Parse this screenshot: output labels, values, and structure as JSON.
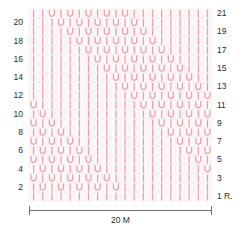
{
  "chart": {
    "stitch_count": 20,
    "row_count": 21,
    "colors": {
      "symbol": "#f09aad",
      "symbol_light": "#f7c6d1",
      "grid_line": "#eef0ee",
      "background": "#fdf7f8",
      "text": "#2b2b2b",
      "rule": "#6e6e6e"
    },
    "symbols": {
      "knit": "I",
      "purl": "U"
    },
    "left_labels": [
      "20",
      "18",
      "16",
      "14",
      "12",
      "10",
      "8",
      "6",
      "4",
      "2"
    ],
    "left_label_rows": [
      20,
      18,
      16,
      14,
      12,
      10,
      8,
      6,
      4,
      2
    ],
    "right_labels": [
      "21",
      "19",
      "17",
      "15",
      "13",
      "11",
      "9",
      "7",
      "5",
      "3",
      "1 R."
    ],
    "right_label_rows": [
      21,
      19,
      17,
      15,
      13,
      11,
      9,
      7,
      5,
      3,
      1
    ],
    "scale": {
      "label": "20 M",
      "value": 20,
      "unit": "M"
    },
    "rows": [
      {
        "row": 21,
        "cells": [
          "I",
          "I",
          "U",
          "I",
          "U",
          "I",
          "U",
          "I",
          "U",
          "I",
          "U",
          "I",
          "I",
          "I",
          "I",
          "I",
          "I",
          "I",
          "I",
          "I"
        ]
      },
      {
        "row": 20,
        "cells": [
          "I",
          "I",
          "I",
          "U",
          "I",
          "U",
          "I",
          "U",
          "I",
          "U",
          "I",
          "U",
          "I",
          "I",
          "I",
          "I",
          "I",
          "I",
          "I",
          "I"
        ]
      },
      {
        "row": 19,
        "cells": [
          "I",
          "I",
          "I",
          "I",
          "U",
          "I",
          "U",
          "I",
          "U",
          "I",
          "U",
          "I",
          "U",
          "I",
          "I",
          "I",
          "I",
          "I",
          "I",
          "I"
        ]
      },
      {
        "row": 18,
        "cells": [
          "I",
          "I",
          "I",
          "I",
          "I",
          "U",
          "I",
          "U",
          "I",
          "U",
          "I",
          "U",
          "I",
          "U",
          "I",
          "I",
          "I",
          "I",
          "I",
          "I"
        ]
      },
      {
        "row": 17,
        "cells": [
          "I",
          "I",
          "I",
          "I",
          "I",
          "I",
          "U",
          "I",
          "U",
          "I",
          "U",
          "I",
          "U",
          "I",
          "U",
          "I",
          "I",
          "I",
          "I",
          "I"
        ]
      },
      {
        "row": 16,
        "cells": [
          "I",
          "I",
          "I",
          "I",
          "I",
          "I",
          "I",
          "U",
          "I",
          "U",
          "I",
          "U",
          "I",
          "U",
          "I",
          "U",
          "I",
          "I",
          "I",
          "I"
        ]
      },
      {
        "row": 15,
        "cells": [
          "I",
          "I",
          "I",
          "I",
          "I",
          "I",
          "I",
          "I",
          "U",
          "I",
          "U",
          "I",
          "U",
          "I",
          "U",
          "I",
          "U",
          "I",
          "I",
          "I"
        ]
      },
      {
        "row": 14,
        "cells": [
          "I",
          "I",
          "I",
          "I",
          "I",
          "I",
          "I",
          "I",
          "I",
          "U",
          "I",
          "U",
          "I",
          "U",
          "I",
          "U",
          "I",
          "U",
          "I",
          "I"
        ]
      },
      {
        "row": 13,
        "cells": [
          "I",
          "I",
          "I",
          "I",
          "I",
          "I",
          "I",
          "I",
          "I",
          "I",
          "U",
          "I",
          "U",
          "I",
          "U",
          "I",
          "U",
          "I",
          "U",
          "I"
        ]
      },
      {
        "row": 12,
        "cells": [
          "I",
          "I",
          "I",
          "I",
          "I",
          "I",
          "I",
          "I",
          "I",
          "I",
          "I",
          "U",
          "I",
          "U",
          "I",
          "U",
          "I",
          "U",
          "I",
          "U"
        ]
      },
      {
        "row": 11,
        "cells": [
          "U",
          "I",
          "I",
          "I",
          "I",
          "I",
          "I",
          "I",
          "I",
          "I",
          "I",
          "I",
          "U",
          "I",
          "U",
          "I",
          "U",
          "I",
          "U",
          "I"
        ]
      },
      {
        "row": 10,
        "cells": [
          "I",
          "U",
          "I",
          "I",
          "I",
          "I",
          "I",
          "I",
          "I",
          "I",
          "I",
          "I",
          "I",
          "U",
          "I",
          "U",
          "I",
          "U",
          "I",
          "U"
        ]
      },
      {
        "row": 9,
        "cells": [
          "U",
          "I",
          "U",
          "I",
          "I",
          "I",
          "I",
          "I",
          "I",
          "I",
          "I",
          "I",
          "I",
          "I",
          "U",
          "I",
          "U",
          "I",
          "U",
          "I"
        ]
      },
      {
        "row": 8,
        "cells": [
          "I",
          "U",
          "I",
          "U",
          "I",
          "I",
          "I",
          "I",
          "I",
          "I",
          "I",
          "I",
          "I",
          "I",
          "I",
          "U",
          "I",
          "U",
          "I",
          "U"
        ]
      },
      {
        "row": 7,
        "cells": [
          "U",
          "I",
          "U",
          "I",
          "U",
          "I",
          "I",
          "I",
          "I",
          "I",
          "I",
          "I",
          "I",
          "I",
          "I",
          "I",
          "U",
          "I",
          "U",
          "I"
        ]
      },
      {
        "row": 6,
        "cells": [
          "I",
          "U",
          "I",
          "U",
          "I",
          "U",
          "I",
          "I",
          "I",
          "I",
          "I",
          "I",
          "I",
          "I",
          "I",
          "I",
          "I",
          "U",
          "I",
          "U"
        ]
      },
      {
        "row": 5,
        "cells": [
          "U",
          "I",
          "U",
          "I",
          "U",
          "I",
          "U",
          "I",
          "I",
          "I",
          "I",
          "I",
          "I",
          "I",
          "I",
          "I",
          "I",
          "I",
          "U",
          "I"
        ]
      },
      {
        "row": 4,
        "cells": [
          "I",
          "U",
          "I",
          "U",
          "I",
          "U",
          "I",
          "U",
          "I",
          "I",
          "I",
          "I",
          "I",
          "I",
          "I",
          "I",
          "I",
          "I",
          "I",
          "U"
        ]
      },
      {
        "row": 3,
        "cells": [
          "U",
          "I",
          "U",
          "I",
          "U",
          "I",
          "U",
          "I",
          "U",
          "I",
          "I",
          "I",
          "I",
          "I",
          "I",
          "I",
          "I",
          "I",
          "I",
          "I"
        ]
      },
      {
        "row": 2,
        "cells": [
          "I",
          "U",
          "I",
          "U",
          "I",
          "U",
          "I",
          "U",
          "I",
          "U",
          "I",
          "I",
          "I",
          "I",
          "I",
          "I",
          "I",
          "I",
          "I",
          "I"
        ]
      },
      {
        "row": 1,
        "cells": [
          "I",
          "I",
          "I",
          "I",
          "I",
          "I",
          "I",
          "I",
          "I",
          "I",
          "I",
          "I",
          "I",
          "I",
          "I",
          "I",
          "I",
          "I",
          "I",
          "I"
        ]
      }
    ]
  }
}
